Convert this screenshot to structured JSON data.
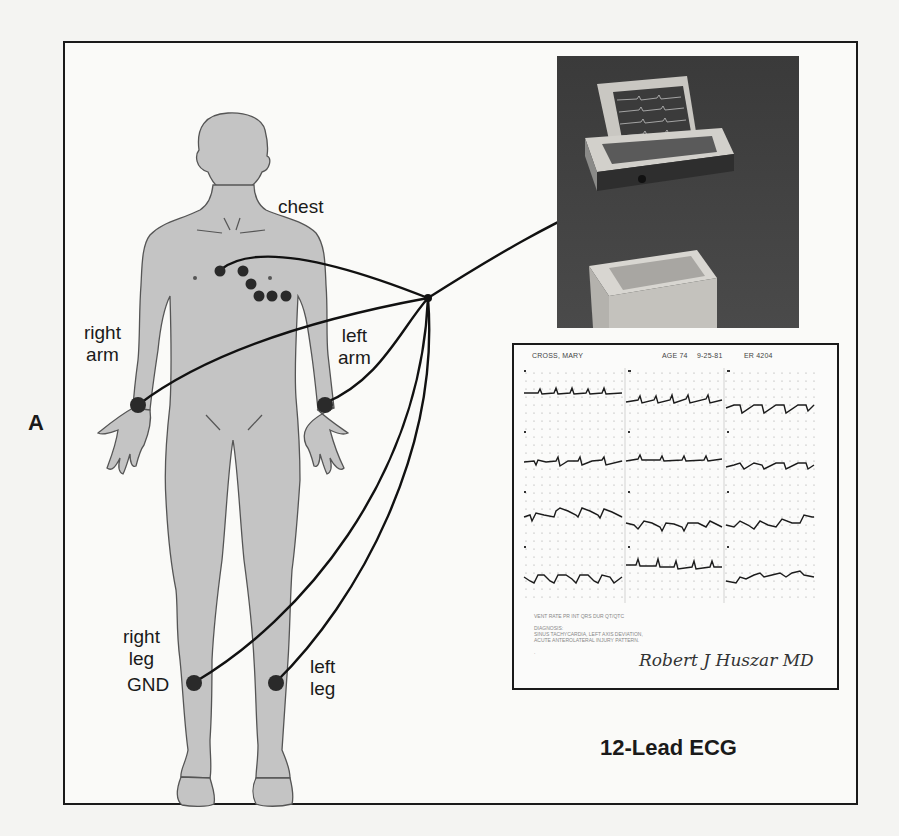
{
  "figure": {
    "panel_label": "A",
    "caption": "12-Lead ECG",
    "colors": {
      "body_fill": "#c4c4c4",
      "body_outline": "#555555",
      "electrode": "#2a2a2a",
      "wire": "#111111",
      "frame": "#1a1a1a",
      "background": "#fafaf8"
    }
  },
  "body_labels": {
    "chest": "chest",
    "right_arm": [
      "right",
      "arm"
    ],
    "left_arm": [
      "left",
      "arm"
    ],
    "right_leg": [
      "right",
      "leg"
    ],
    "gnd": "GND",
    "left_leg": [
      "left",
      "leg"
    ]
  },
  "ecg_report": {
    "patient_name": "CROSS, MARY",
    "age": "AGE 74",
    "date": "9-25-81",
    "record": "ER 4204",
    "lead_rows": [
      [
        "I",
        "II",
        "III"
      ],
      [
        "aVR",
        "aVL",
        "aVF"
      ],
      [
        "V1",
        "V2",
        "V3"
      ],
      [
        "V4",
        "V5",
        "V6"
      ]
    ],
    "notes": [
      "VENT RATE  PR INT  QRS DUR  QT/QTC",
      "DIAGNOSIS:",
      "SINUS TACHYCARDIA, LEFT AXIS DEVIATION,",
      "ACUTE ANTEROLATERAL INJURY PATTERN.",
      "."
    ],
    "signature": "Robert J Huszar MD"
  },
  "device_photo": {
    "description": "ECG monitor/defibrillator with open screen"
  }
}
